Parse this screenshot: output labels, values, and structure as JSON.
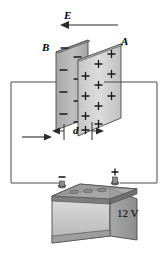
{
  "figure": {
    "background_color": "#ffffff",
    "line_color": "#3a3a3a",
    "ink_color": "#000000"
  },
  "labels": {
    "field_label": "E",
    "plate_back_label": "B",
    "plate_front_label": "A",
    "separation_label": "d",
    "battery_voltage": "12 V",
    "terminal_negative": "–",
    "terminal_positive": "+"
  },
  "field_arrow": {
    "name": "electric-field-arrow",
    "direction": "left",
    "x_start": 118,
    "x_end": 62,
    "y": 25
  },
  "plates": {
    "back": {
      "name": "capacitor-plate-b",
      "charge_sign": "–",
      "charge_count": 8,
      "fill_color": "#b8b8b8",
      "edge_color": "#4a4a4a"
    },
    "front": {
      "name": "capacitor-plate-a",
      "charge_sign": "+",
      "charge_count": 11,
      "fill_color": "#d2d2d2",
      "edge_color": "#4a4a4a"
    }
  },
  "dimension": {
    "name": "plate-separation-dimension",
    "label": "d",
    "x_left": 56,
    "x_right": 100,
    "y": 131
  },
  "circuit": {
    "name": "circuit-wire-loop",
    "wire_top_y": 82,
    "wire_left_x": 11,
    "wire_right_x": 157,
    "wire_bottom_y": 183
  },
  "battery": {
    "name": "car-battery",
    "voltage": "12 V",
    "body_color": "#c9c9c9",
    "top_color": "#8e8e8e",
    "terminals": [
      "–",
      "+"
    ]
  }
}
